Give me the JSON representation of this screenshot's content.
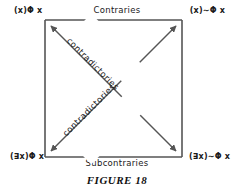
{
  "figure": {
    "caption": "FIGURE 18",
    "type": "square-of-opposition"
  },
  "corners": {
    "top_left": "(x)Φ x",
    "top_right": "(x)∼Φ x",
    "bottom_left": "(∃x)Φ x",
    "bottom_right": "(∃x)∼Φ x"
  },
  "relations": {
    "top": "Contraries",
    "bottom": "Subcontraries",
    "diagonal_descending": "contradictories",
    "diagonal_ascending": "contradictories"
  },
  "style": {
    "line_color": "#555555",
    "text_color": "#1a1a1a",
    "background": "#ffffff"
  }
}
